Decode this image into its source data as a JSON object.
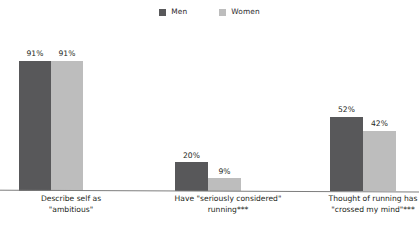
{
  "legend": {
    "position": "top-center",
    "entries": [
      {
        "label": "Men",
        "color": "#58585a",
        "swatch_icon": "square-swatch-icon"
      },
      {
        "label": "Women",
        "color": "#bdbdbd",
        "swatch_icon": "square-swatch-icon"
      }
    ]
  },
  "chart_data": {
    "type": "bar",
    "title": "",
    "subtitle": "",
    "xlabel": "",
    "ylabel": "",
    "ylim": [
      0,
      100
    ],
    "grid": false,
    "legend_position": "top-center",
    "value_label_suffix": "%",
    "categories": [
      "Describe self as \"ambitious\"",
      "Have \"seriously considered\" running***",
      "Thought of running has \"crossed my mind\"***"
    ],
    "category_lines": [
      [
        "Describe self as",
        "\"ambitious\""
      ],
      [
        "Have \"seriously considered\"",
        "running***"
      ],
      [
        "Thought of running has",
        "\"crossed my mind\"***"
      ]
    ],
    "series": [
      {
        "name": "Men",
        "color": "#58585a",
        "values": [
          91,
          20,
          52
        ],
        "labels": [
          "91%",
          "20%",
          "52%"
        ]
      },
      {
        "name": "Women",
        "color": "#bdbdbd",
        "values": [
          91,
          9,
          42
        ],
        "labels": [
          "91%",
          "9%",
          "42%"
        ]
      }
    ]
  }
}
